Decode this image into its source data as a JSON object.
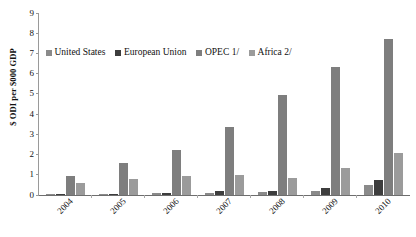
{
  "chart_data": {
    "type": "bar",
    "title": "",
    "xlabel": "",
    "ylabel": "$ ODI per $000 GDP",
    "ylim": [
      0,
      9
    ],
    "yticks": [
      0,
      1,
      2,
      3,
      4,
      5,
      6,
      7,
      8,
      9
    ],
    "ytick_labels": [
      "0",
      "1",
      "2",
      "3",
      "4",
      "5",
      "6",
      "7",
      "8",
      "9"
    ],
    "grid": false,
    "legend_position": "top-left-inside",
    "categories": [
      "2004",
      "2005",
      "2006",
      "2007",
      "2008",
      "2009",
      "2010"
    ],
    "series": [
      {
        "name": "United States",
        "color": "#8a8a8a",
        "values": [
          0.05,
          0.05,
          0.08,
          0.12,
          0.15,
          0.22,
          0.5
        ]
      },
      {
        "name": "European Union",
        "color": "#3d3d3d",
        "values": [
          0.04,
          0.06,
          0.1,
          0.18,
          0.2,
          0.35,
          0.75
        ]
      },
      {
        "name": "OPEC 1/",
        "color": "#7e7e7e",
        "values": [
          0.95,
          1.6,
          2.25,
          3.35,
          4.95,
          6.35,
          7.7
        ]
      },
      {
        "name": "Africa 2/",
        "color": "#9b9b9b",
        "values": [
          0.6,
          0.8,
          0.95,
          1.0,
          0.85,
          1.35,
          2.1
        ]
      }
    ]
  },
  "legend": {
    "items": [
      {
        "label": "United States"
      },
      {
        "label": "European Union"
      },
      {
        "label": "OPEC 1/"
      },
      {
        "label": "Africa 2/"
      }
    ]
  }
}
